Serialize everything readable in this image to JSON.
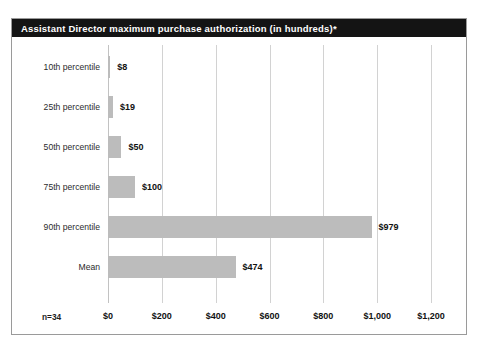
{
  "chart_data": {
    "type": "bar",
    "orientation": "horizontal",
    "title": "Assistant Director maximum purchase authorization (in hundreds)*",
    "xlabel": "",
    "ylabel": "",
    "xlim": [
      0,
      1200
    ],
    "grid": true,
    "legend": false,
    "sample_size_label": "n=34",
    "categories": [
      "10th percentile",
      "25th percentile",
      "50th percentile",
      "75th percentile",
      "90th percentile",
      "Mean"
    ],
    "values": [
      8,
      19,
      50,
      100,
      979,
      474
    ],
    "value_labels": [
      "$8",
      "$19",
      "$50",
      "$100",
      "$979",
      "$474"
    ],
    "xticks": [
      0,
      200,
      400,
      600,
      800,
      1000,
      1200
    ],
    "xtick_labels": [
      "$0",
      "$200",
      "$400",
      "$600",
      "$800",
      "$1,000",
      "$1,200"
    ],
    "colors": {
      "bar_fill": "#bcbcbc",
      "title_bar_background": "#141414",
      "title_text": "#ffffff",
      "gridline": "#d2d2d2",
      "border": "#9a9a9a",
      "label_text": "#2b2b2b",
      "value_text": "#111111",
      "background": "#ffffff"
    }
  }
}
